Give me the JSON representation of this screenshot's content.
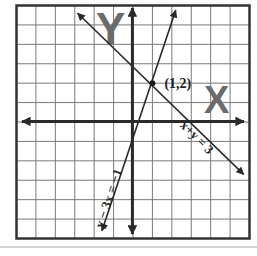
{
  "diagram": {
    "grid": {
      "x_min": -6,
      "x_max": 6,
      "y_min": -6,
      "y_max": 6,
      "step": 1
    },
    "axes": {
      "x_label": "X",
      "y_label": "Y"
    },
    "lines": [
      {
        "equation": "x+y = 3",
        "label": "x+y = 3",
        "slope": -1,
        "intercept": 3
      },
      {
        "equation": "y − 3x = −1",
        "label": "y − 3x = −1",
        "slope": 3,
        "intercept": -1
      }
    ],
    "intersection": {
      "x": 1,
      "y": 2,
      "label": "(1,2)"
    },
    "colors": {
      "grid": "#7a7a7a",
      "frame": "#333333",
      "axis": "#2a2a2a",
      "line": "#2a2a2a",
      "axis_letter": "#6b6b6b"
    }
  }
}
